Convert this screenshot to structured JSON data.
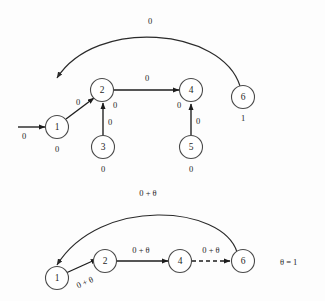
{
  "figure": {
    "background_color": "#fdfdfd",
    "stroke_color": "#1c1c1c",
    "node_stroke_color": "#4a4a4a",
    "theta_note": "θ = 1"
  },
  "top_graph": {
    "nodes": [
      {
        "id": "n1",
        "label": "1",
        "value": "0"
      },
      {
        "id": "n2",
        "label": "2",
        "value": "0"
      },
      {
        "id": "n3",
        "label": "3",
        "value": "0"
      },
      {
        "id": "n4",
        "label": "4",
        "value": "0"
      },
      {
        "id": "n5",
        "label": "5",
        "value": "0"
      },
      {
        "id": "n6",
        "label": "6",
        "value": "1"
      }
    ],
    "edges": [
      {
        "from": "entry",
        "to": "n1",
        "label": "0",
        "style": "solid"
      },
      {
        "from": "n6",
        "to": "n1",
        "label": "0",
        "style": "arc"
      },
      {
        "from": "n1",
        "to": "n2",
        "label": "0",
        "style": "solid"
      },
      {
        "from": "n3",
        "to": "n2",
        "label": "0",
        "style": "solid"
      },
      {
        "from": "n2",
        "to": "n4",
        "label": "0",
        "style": "solid"
      },
      {
        "from": "n5",
        "to": "n4",
        "label": "0",
        "style": "solid"
      }
    ]
  },
  "bottom_graph": {
    "nodes": [
      {
        "id": "m1",
        "label": "1"
      },
      {
        "id": "m2",
        "label": "2"
      },
      {
        "id": "m4",
        "label": "4"
      },
      {
        "id": "m6",
        "label": "6"
      }
    ],
    "edges": [
      {
        "from": "m6",
        "to": "m1",
        "label": "0 + θ",
        "style": "arc"
      },
      {
        "from": "m1",
        "to": "m2",
        "label": "0 + θ",
        "style": "solid"
      },
      {
        "from": "m2",
        "to": "m4",
        "label": "0 + θ",
        "style": "solid"
      },
      {
        "from": "m4",
        "to": "m6",
        "label": "0 + θ",
        "style": "dashed"
      }
    ]
  }
}
